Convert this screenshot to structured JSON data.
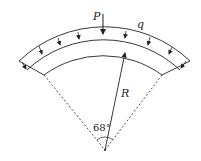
{
  "diagram": {
    "type": "curved beam / arch segment under load",
    "labels": {
      "point_load": "P",
      "distributed_load": "q",
      "radius": "R",
      "angle": "68°"
    },
    "geometry": {
      "central_angle_deg": 68,
      "center": [
        105,
        150
      ]
    },
    "colors": {
      "stroke": "#222222",
      "background": "#ffffff"
    }
  }
}
